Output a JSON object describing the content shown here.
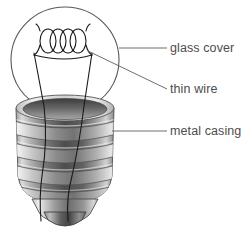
{
  "figure": {
    "background_color": "#ffffff",
    "label_color": "#4d4d4d",
    "leader_line_color": "#6e6e6e",
    "outline_color": "#555555",
    "wire_color": "#1a1a1a",
    "metal_light": "#e2e2e2",
    "metal_mid": "#9a9a9a",
    "metal_dark": "#4a4a4a",
    "metal_shadow": "#2e2e2e"
  },
  "labels": [
    {
      "id": "glass-cover",
      "text": "glass cover",
      "leader": "horizontal"
    },
    {
      "id": "thin-wire",
      "text": "thin wire",
      "leader": "diagonal"
    },
    {
      "id": "metal-casing",
      "text": "metal casing",
      "leader": "horizontal"
    }
  ],
  "parts": {
    "glass_cover": "glass cover",
    "thin_wire": "thin wire",
    "metal_casing": "metal casing"
  },
  "details": {
    "filament_coil_loops": 4,
    "casing_thread_count": 4,
    "support_wire_count": 2
  }
}
